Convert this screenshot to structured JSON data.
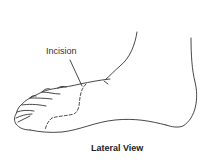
{
  "figure": {
    "labels": {
      "incision": "Incision"
    },
    "caption": "Lateral View",
    "colors": {
      "outline": "#333333",
      "text": "#222222",
      "background": "#ffffff"
    }
  }
}
